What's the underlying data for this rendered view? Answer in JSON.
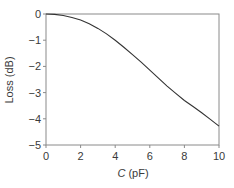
{
  "chart_data": {
    "type": "line",
    "title": "",
    "xlabel": "C (pF)",
    "xlabel_var": "C",
    "xlabel_unit": " (pF)",
    "ylabel": "Loss (dB)",
    "xlim": [
      0,
      10
    ],
    "ylim": [
      -5,
      0
    ],
    "xticks": [
      0,
      2,
      4,
      6,
      8,
      10
    ],
    "yticks": [
      0,
      -1,
      -2,
      -3,
      -4,
      -5
    ],
    "xtick_labels": [
      "0",
      "2",
      "4",
      "6",
      "8",
      "10"
    ],
    "ytick_labels": [
      "0",
      "−1",
      "−2",
      "−3",
      "−4",
      "−5"
    ],
    "grid": false,
    "legend": null,
    "series": [
      {
        "name": "Loss",
        "color": "#333333",
        "x": [
          0,
          0.5,
          1,
          1.5,
          2,
          2.5,
          3,
          3.5,
          4,
          4.5,
          5,
          5.5,
          6,
          6.5,
          7,
          7.5,
          8,
          8.5,
          9,
          9.5,
          10
        ],
        "y": [
          0,
          -0.015,
          -0.06,
          -0.13,
          -0.23,
          -0.37,
          -0.55,
          -0.76,
          -1.0,
          -1.27,
          -1.55,
          -1.84,
          -2.14,
          -2.45,
          -2.75,
          -3.03,
          -3.3,
          -3.53,
          -3.77,
          -4.02,
          -4.28
        ]
      }
    ],
    "colors": {
      "axis": "#8a8a8a",
      "curve": "#333333",
      "text": "#3a3a3a"
    }
  }
}
